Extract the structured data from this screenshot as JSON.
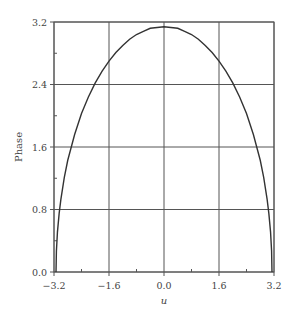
{
  "chart_data": {
    "type": "line",
    "title": "",
    "xlabel": "u",
    "ylabel": "Phase",
    "xlim": [
      -3.2,
      3.2
    ],
    "ylim": [
      0.0,
      3.2
    ],
    "grid": true,
    "legend": null,
    "x_ticks": [
      -3.2,
      -1.6,
      0.0,
      1.6,
      3.2
    ],
    "x_tick_labels": [
      "−3.2",
      "−1.6",
      "0.0",
      "1.6",
      "3.2"
    ],
    "y_ticks": [
      0.0,
      0.8,
      1.6,
      2.4,
      3.2
    ],
    "y_tick_labels": [
      "0.0",
      "0.8",
      "1.6",
      "2.4",
      "3.2"
    ],
    "series": [
      {
        "name": "Phase",
        "x": [
          -3.1416,
          -3.13,
          -3.1,
          -3.05,
          -3.0,
          -2.9,
          -2.8,
          -2.6,
          -2.4,
          -2.2,
          -2.0,
          -1.8,
          -1.6,
          -1.4,
          -1.2,
          -1.0,
          -0.8,
          -0.6,
          -0.4,
          -0.2,
          0.0,
          0.2,
          0.4,
          0.6,
          0.8,
          1.0,
          1.2,
          1.4,
          1.6,
          1.8,
          2.0,
          2.2,
          2.4,
          2.6,
          2.8,
          2.9,
          3.0,
          3.05,
          3.1,
          3.13,
          3.1416
        ],
        "y": [
          0.0,
          0.27,
          0.51,
          0.75,
          0.93,
          1.21,
          1.43,
          1.76,
          2.03,
          2.24,
          2.42,
          2.57,
          2.7,
          2.81,
          2.9,
          2.98,
          3.04,
          3.08,
          3.12,
          3.13,
          3.14,
          3.13,
          3.12,
          3.08,
          3.04,
          2.98,
          2.9,
          2.81,
          2.7,
          2.57,
          2.42,
          2.24,
          2.03,
          1.76,
          1.43,
          1.21,
          0.93,
          0.75,
          0.51,
          0.27,
          0.0
        ]
      }
    ]
  }
}
